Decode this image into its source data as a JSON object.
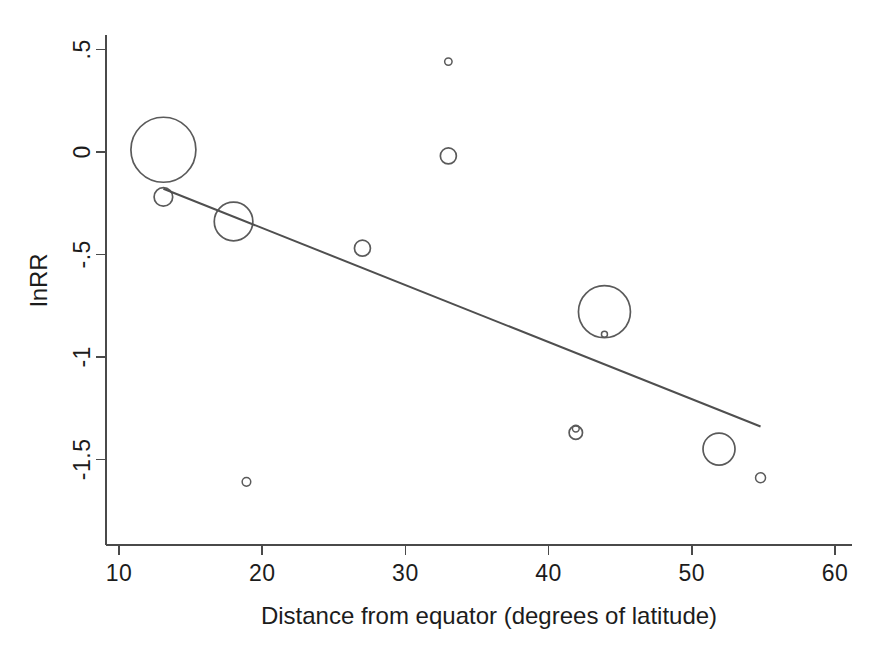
{
  "chart_data": {
    "type": "scatter",
    "title": "",
    "subtitle": "",
    "xlabel": "Distance from equator (degrees of latitude)",
    "ylabel": "lnRR",
    "xlim": [
      8.9,
      61.5
    ],
    "ylim": [
      -1.73,
      0.55
    ],
    "xticks": [
      10,
      20,
      30,
      40,
      50,
      60
    ],
    "xticklabels": [
      "10",
      "20",
      "30",
      "40",
      "50",
      "60"
    ],
    "yticks": [
      0.5,
      0,
      -0.5,
      -1,
      -1.5
    ],
    "yticklabels": [
      ".5",
      "0",
      "-.5",
      "-1",
      "-1.5"
    ],
    "grid": false,
    "legend": "none",
    "marker": "open-circle",
    "size_encoding": "study weight (inverse variance)",
    "points": [
      {
        "x": 13.1,
        "y": 0.01,
        "size": 32.5
      },
      {
        "x": 13.1,
        "y": -0.22,
        "size": 9.3
      },
      {
        "x": 18.0,
        "y": -0.34,
        "size": 19.3
      },
      {
        "x": 18.9,
        "y": -1.61,
        "size": 4.3
      },
      {
        "x": 27.0,
        "y": -0.47,
        "size": 8.0
      },
      {
        "x": 33.0,
        "y": 0.44,
        "size": 3.7
      },
      {
        "x": 33.0,
        "y": -0.02,
        "size": 8.0
      },
      {
        "x": 41.9,
        "y": -1.35,
        "size": 3.4
      },
      {
        "x": 41.9,
        "y": -1.37,
        "size": 6.7
      },
      {
        "x": 43.9,
        "y": -0.78,
        "size": 26.0
      },
      {
        "x": 43.9,
        "y": -0.89,
        "size": 3.0
      },
      {
        "x": 51.9,
        "y": -1.45,
        "size": 16.0
      },
      {
        "x": 54.8,
        "y": -1.59,
        "size": 5.0
      }
    ],
    "fit_line": {
      "x_start": 13.1,
      "y_start": -0.18,
      "x_end": 54.8,
      "y_end": -1.34
    }
  },
  "figure": {
    "background_color": "#ffffff",
    "axis_color": "#4a4a4a",
    "marker_color": "#5a5a5a",
    "line_color": "#4f4f4f",
    "text_color": "#1c1c1c"
  }
}
